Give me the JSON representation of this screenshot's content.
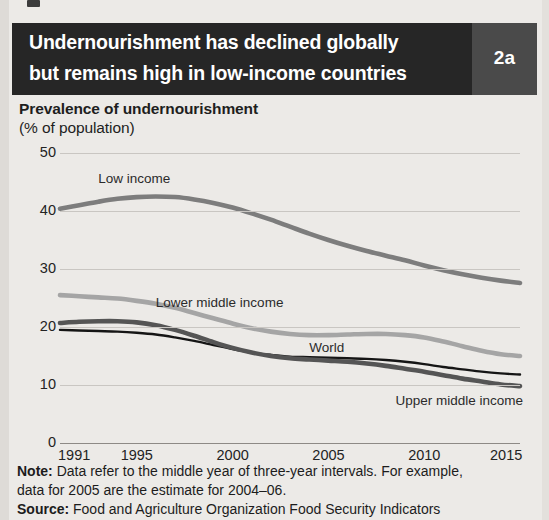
{
  "banner": {
    "title_line1": "Undernourishment has declined globally",
    "title_line2": "but remains high in low-income countries",
    "badge": "2a"
  },
  "chart_title": "Prevalence of undernourishment",
  "chart_subtitle": "(% of population)",
  "footer": {
    "note_label": "Note:",
    "note_text_1": " Data refer to the middle year of three-year intervals. For example,",
    "note_text_2": "data for 2005 are the estimate for 2004–06.",
    "source_label": "Source:",
    "source_text": " Food and Agriculture Organization Food Security Indicators"
  },
  "colors": {
    "banner_bg": "#262626",
    "badge_bg": "#4a4a4a",
    "page_bg": "#eceae7",
    "grid": "#c9c6c2",
    "low_income": "#7d7d7d",
    "lower_middle_income": "#a5a5a5",
    "world": "#151515",
    "upper_middle_income": "#555555"
  },
  "chart_data": {
    "type": "line",
    "title": "Prevalence of undernourishment",
    "subtitle": "(% of population)",
    "xlabel": "",
    "ylabel": "% of population",
    "xlim": [
      1991,
      2015
    ],
    "ylim": [
      0,
      50
    ],
    "yticks": [
      0,
      10,
      20,
      30,
      40,
      50
    ],
    "xticks": [
      1991,
      1995,
      2000,
      2005,
      2010,
      2015
    ],
    "grid": true,
    "legend": "inline-labels",
    "x": [
      1991,
      1992,
      1993,
      1994,
      1995,
      1996,
      1997,
      1998,
      1999,
      2000,
      2001,
      2002,
      2003,
      2004,
      2005,
      2006,
      2007,
      2008,
      2009,
      2010,
      2011,
      2012,
      2013,
      2014,
      2015
    ],
    "series": [
      {
        "name": "Low income",
        "color": "#7d7d7d",
        "label_x": 1993.0,
        "label_y": 45.5,
        "values": [
          40.4,
          41.0,
          41.6,
          42.1,
          42.4,
          42.5,
          42.4,
          42.0,
          41.4,
          40.6,
          39.6,
          38.5,
          37.3,
          36.1,
          35.0,
          34.0,
          33.1,
          32.3,
          31.5,
          30.6,
          29.8,
          29.1,
          28.5,
          28.0,
          27.6
        ]
      },
      {
        "name": "Lower middle income",
        "color": "#a5a5a5",
        "label_x": 1996.0,
        "label_y": 24.2,
        "values": [
          25.5,
          25.3,
          25.1,
          24.9,
          24.5,
          24.0,
          23.3,
          22.4,
          21.5,
          20.6,
          19.8,
          19.2,
          18.8,
          18.6,
          18.6,
          18.7,
          18.8,
          18.8,
          18.6,
          18.2,
          17.5,
          16.7,
          15.9,
          15.3,
          15.0
        ]
      },
      {
        "name": "World",
        "color": "#151515",
        "label_x": 2004.0,
        "label_y": 16.3,
        "values": [
          19.5,
          19.4,
          19.3,
          19.2,
          19.0,
          18.7,
          18.2,
          17.6,
          16.9,
          16.2,
          15.6,
          15.2,
          14.9,
          14.8,
          14.7,
          14.6,
          14.5,
          14.3,
          14.0,
          13.6,
          13.1,
          12.7,
          12.3,
          12.0,
          11.8
        ]
      },
      {
        "name": "Upper middle income",
        "color": "#555555",
        "label_x": 2008.5,
        "label_y": 7.2,
        "values": [
          20.7,
          20.9,
          21.0,
          21.0,
          20.8,
          20.3,
          19.5,
          18.5,
          17.4,
          16.4,
          15.6,
          15.0,
          14.6,
          14.4,
          14.2,
          14.0,
          13.7,
          13.3,
          12.8,
          12.3,
          11.7,
          11.1,
          10.6,
          10.1,
          9.8
        ]
      }
    ]
  }
}
